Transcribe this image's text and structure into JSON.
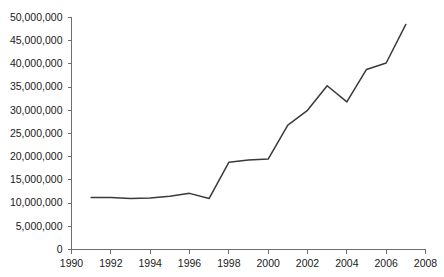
{
  "chart_data": {
    "type": "line",
    "title": "",
    "subtitle": "",
    "xlabel": "",
    "ylabel": "",
    "x": [
      1991,
      1992,
      1993,
      1994,
      1995,
      1996,
      1997,
      1998,
      1999,
      2000,
      2001,
      2002,
      2003,
      2004,
      2005,
      2006,
      2007
    ],
    "values": [
      11200000,
      11200000,
      11000000,
      11100000,
      11500000,
      12100000,
      11000000,
      18800000,
      19300000,
      19500000,
      26800000,
      30000000,
      35300000,
      31800000,
      38800000,
      40200000,
      48500000
    ],
    "series": [
      {
        "name": "",
        "values": [
          11200000,
          11200000,
          11000000,
          11100000,
          11500000,
          12100000,
          11000000,
          18800000,
          19300000,
          19500000,
          26800000,
          30000000,
          35300000,
          31800000,
          38800000,
          40200000,
          48500000
        ]
      }
    ],
    "xlim": [
      1990,
      2008
    ],
    "ylim": [
      0,
      50000000
    ],
    "xticks": [
      1990,
      1992,
      1994,
      1996,
      1998,
      2000,
      2002,
      2004,
      2006,
      2008
    ],
    "yticks": [
      0,
      5000000,
      10000000,
      15000000,
      20000000,
      25000000,
      30000000,
      35000000,
      40000000,
      45000000,
      50000000
    ],
    "xtick_labels": [
      "1990",
      "1992",
      "1994",
      "1996",
      "1998",
      "2000",
      "2002",
      "2004",
      "2006",
      "2008"
    ],
    "ytick_labels": [
      "0",
      "5,000,000",
      "10,000,000",
      "15,000,000",
      "20,000,000",
      "25,000,000",
      "30,000,000",
      "35,000,000",
      "40,000,000",
      "45,000,000",
      "50,000,000"
    ],
    "grid": false,
    "legend": false,
    "legend_position": "none",
    "line_color": "#3a3a3a",
    "axis_color": "#6e6e6e",
    "background_color": "#ffffff",
    "annotations": []
  }
}
